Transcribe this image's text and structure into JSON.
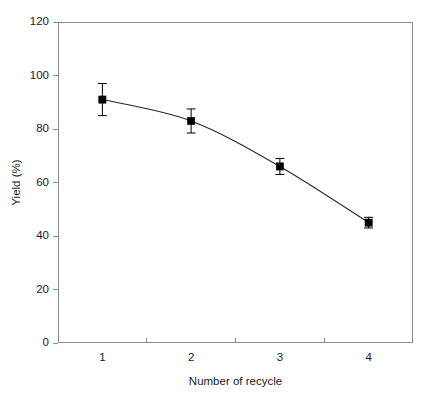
{
  "chart_data": {
    "type": "line",
    "title": "",
    "xlabel": "Number of recycle",
    "ylabel": "Yield (%)",
    "categories": [
      "1",
      "2",
      "3",
      "4"
    ],
    "values": [
      91,
      83,
      66,
      45
    ],
    "errors": [
      6,
      4.5,
      3,
      2
    ],
    "yticks": [
      0,
      20,
      40,
      60,
      80,
      100,
      120
    ],
    "xticks": [
      "1",
      "2",
      "3",
      "4"
    ],
    "ylim": [
      0,
      120
    ],
    "grid": false,
    "legend": null,
    "series": [
      {
        "name": "Yield",
        "values": [
          91,
          83,
          66,
          45
        ],
        "errors": [
          6,
          4.5,
          3,
          2
        ],
        "marker": "filled-square",
        "line_color": "#262626",
        "marker_color": "#000000"
      }
    ],
    "annotations": []
  },
  "axis": {
    "y_title": "Yield (%)",
    "x_title": "Number of recycle",
    "y_tick_labels": [
      "0",
      "20",
      "40",
      "60",
      "80",
      "100",
      "120"
    ],
    "x_tick_labels": [
      "1",
      "2",
      "3",
      "4"
    ]
  },
  "style": {
    "background": "#ffffff",
    "frame_color": "#8c8c8c",
    "line_color": "#262626",
    "marker_color": "#000000",
    "text_color": "#1a1a1a"
  }
}
